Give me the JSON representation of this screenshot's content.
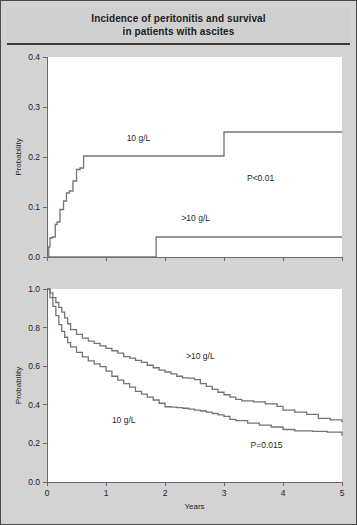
{
  "figure": {
    "title_line1": "Incidence of peritonitis and survival",
    "title_line2": "in patients with ascites",
    "background_color": "#d3d3d3",
    "panel_color": "#ffffff",
    "curve_color": "#6f7579",
    "axis_color": "#6b6b6b"
  },
  "chart_data": [
    {
      "type": "line",
      "id": "incidence",
      "title": "Incidence of peritonitis",
      "xlabel": "",
      "ylabel": "Probability",
      "xlim": [
        0,
        5
      ],
      "ylim": [
        0,
        0.4
      ],
      "xticks": [
        0,
        1,
        2,
        3,
        4,
        5
      ],
      "xticklabels": [
        "",
        "",
        "",
        "",
        "",
        ""
      ],
      "yticks": [
        0.0,
        0.1,
        0.2,
        0.3,
        0.4
      ],
      "yticklabels": [
        "0.0",
        "0.1",
        "0.2",
        "0.3",
        "0.4"
      ],
      "grid": false,
      "legend_position": "inline-annotations",
      "annotations": [
        {
          "text": "10 g/L",
          "x": 1.55,
          "y": 0.233
        },
        {
          "text": ">10 g/L",
          "x": 2.52,
          "y": 0.072
        },
        {
          "text": "P<0.01",
          "x": 3.62,
          "y": 0.152
        }
      ],
      "series": [
        {
          "name": "10 g/L",
          "step": "post",
          "x": [
            0.0,
            0.03,
            0.05,
            0.09,
            0.14,
            0.17,
            0.22,
            0.28,
            0.33,
            0.38,
            0.44,
            0.5,
            0.56,
            0.62,
            3.0,
            5.0
          ],
          "y": [
            0.0,
            0.02,
            0.038,
            0.04,
            0.065,
            0.07,
            0.095,
            0.112,
            0.128,
            0.132,
            0.152,
            0.175,
            0.178,
            0.202,
            0.25,
            0.25
          ]
        },
        {
          "name": ">10 g/L",
          "step": "post",
          "x": [
            0.0,
            1.85,
            5.0
          ],
          "y": [
            0.0,
            0.04,
            0.04
          ]
        }
      ]
    },
    {
      "type": "line",
      "id": "survival",
      "title": "Survival",
      "xlabel": "Years",
      "ylabel": "Probability",
      "xlim": [
        0,
        5
      ],
      "ylim": [
        0,
        1.0
      ],
      "xticks": [
        0,
        1,
        2,
        3,
        4,
        5
      ],
      "xticklabels": [
        "0",
        "1",
        "2",
        "3",
        "4",
        "5"
      ],
      "yticks": [
        0.0,
        0.2,
        0.4,
        0.6,
        0.8,
        1.0
      ],
      "yticklabels": [
        "0.0",
        "0.2",
        "0.4",
        "0.6",
        "0.8",
        "1.0"
      ],
      "grid": false,
      "legend_position": "inline-annotations",
      "annotations": [
        {
          "text": ">10 g/L",
          "x": 2.6,
          "y": 0.635
        },
        {
          "text": "10 g/L",
          "x": 1.3,
          "y": 0.305
        },
        {
          "text": "P=0.015",
          "x": 3.72,
          "y": 0.175
        }
      ],
      "series": [
        {
          "name": ">10 g/L",
          "step": "post",
          "x": [
            0.0,
            0.05,
            0.1,
            0.15,
            0.2,
            0.25,
            0.3,
            0.35,
            0.4,
            0.5,
            0.6,
            0.7,
            0.8,
            0.9,
            1.0,
            1.1,
            1.2,
            1.3,
            1.4,
            1.5,
            1.6,
            1.7,
            1.8,
            1.9,
            2.0,
            2.1,
            2.2,
            2.3,
            2.4,
            2.5,
            2.6,
            2.7,
            2.8,
            2.9,
            3.0,
            3.1,
            3.2,
            3.3,
            3.5,
            3.7,
            3.9,
            4.0,
            4.2,
            4.4,
            4.6,
            4.8,
            5.0
          ],
          "y": [
            1.0,
            0.98,
            0.955,
            0.93,
            0.905,
            0.88,
            0.85,
            0.82,
            0.79,
            0.765,
            0.745,
            0.73,
            0.718,
            0.705,
            0.692,
            0.68,
            0.668,
            0.65,
            0.642,
            0.63,
            0.62,
            0.605,
            0.592,
            0.58,
            0.57,
            0.56,
            0.548,
            0.54,
            0.538,
            0.53,
            0.51,
            0.495,
            0.48,
            0.465,
            0.452,
            0.44,
            0.428,
            0.42,
            0.415,
            0.405,
            0.392,
            0.372,
            0.362,
            0.35,
            0.33,
            0.322,
            0.31
          ]
        },
        {
          "name": "10 g/L",
          "step": "post",
          "x": [
            0.0,
            0.05,
            0.1,
            0.15,
            0.2,
            0.25,
            0.3,
            0.35,
            0.4,
            0.5,
            0.6,
            0.7,
            0.8,
            0.9,
            1.0,
            1.1,
            1.2,
            1.3,
            1.4,
            1.5,
            1.6,
            1.7,
            1.8,
            1.9,
            2.0,
            2.1,
            2.2,
            2.3,
            2.4,
            2.5,
            2.6,
            2.7,
            2.8,
            2.9,
            3.0,
            3.1,
            3.2,
            3.4,
            3.6,
            3.8,
            4.0,
            4.2,
            4.5,
            4.75,
            5.0
          ],
          "y": [
            1.0,
            0.955,
            0.91,
            0.862,
            0.815,
            0.78,
            0.75,
            0.722,
            0.7,
            0.672,
            0.648,
            0.628,
            0.612,
            0.598,
            0.575,
            0.548,
            0.528,
            0.51,
            0.492,
            0.47,
            0.455,
            0.44,
            0.425,
            0.408,
            0.39,
            0.388,
            0.385,
            0.382,
            0.378,
            0.372,
            0.368,
            0.362,
            0.355,
            0.348,
            0.34,
            0.325,
            0.318,
            0.305,
            0.295,
            0.285,
            0.272,
            0.265,
            0.262,
            0.258,
            0.24
          ]
        }
      ]
    }
  ]
}
